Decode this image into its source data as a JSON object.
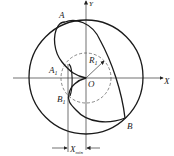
{
  "diagram": {
    "labels": {
      "A": "A",
      "A1_main": "A",
      "A1_sub": "1",
      "B": "B",
      "B1_main": "B",
      "B1_sub": "1",
      "O": "O",
      "R1_main": "R",
      "R1_sub": "1",
      "X": "X",
      "Y": "Y",
      "Xmin_main": "X",
      "Xmin_sub": "min"
    },
    "colors": {
      "stroke": "#1a1a1a",
      "dashed": "#555555",
      "background": "#ffffff"
    }
  }
}
